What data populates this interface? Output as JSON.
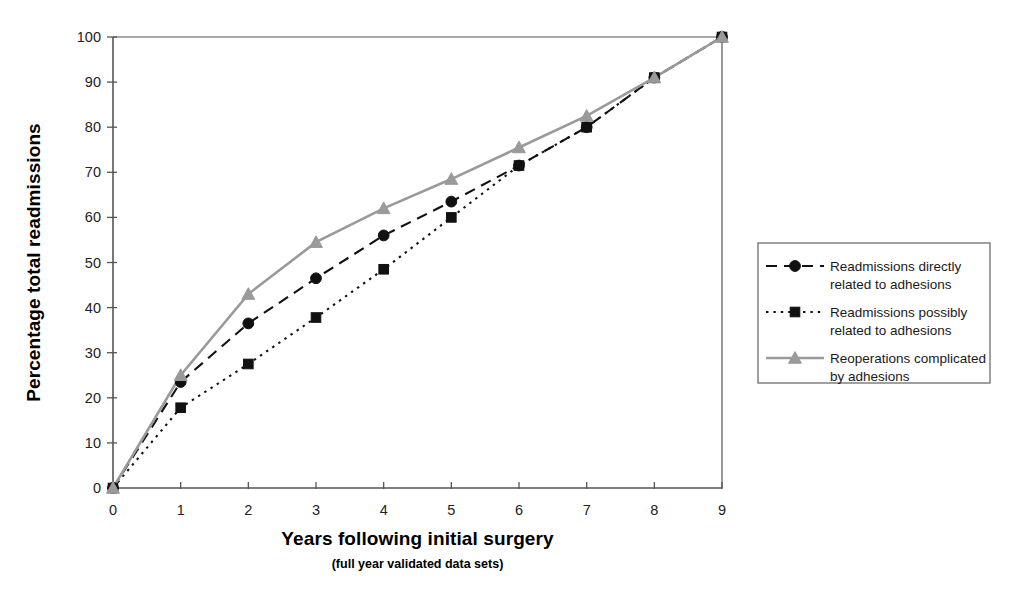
{
  "chart_data": {
    "type": "line",
    "title": "",
    "xlabel": "Years following initial surgery",
    "xlabel_sub": "(full year validated data sets)",
    "ylabel": "Percentage total readmissions",
    "x": [
      0,
      1,
      2,
      3,
      4,
      5,
      6,
      7,
      8,
      9
    ],
    "xlim": [
      0,
      9
    ],
    "ylim": [
      0,
      100
    ],
    "xticks": [
      "0",
      "1",
      "2",
      "3",
      "4",
      "5",
      "6",
      "7",
      "8",
      "9"
    ],
    "yticks": [
      "0",
      "10",
      "20",
      "30",
      "40",
      "50",
      "60",
      "70",
      "80",
      "90",
      "100"
    ],
    "grid": false,
    "legend_position": "right",
    "series": [
      {
        "name": "Readmissions directly related to adhesions",
        "legend_line1": "Readmissions directly",
        "legend_line2": "related to adhesions",
        "values": [
          0,
          23.5,
          36.5,
          46.5,
          56,
          63.5,
          71.5,
          80,
          91,
          100
        ],
        "color": "#111111",
        "linestyle": "dashed",
        "marker": "circle"
      },
      {
        "name": "Readmissions possibly related to adhesions",
        "legend_line1": "Readmissions possibly",
        "legend_line2": "related to adhesions",
        "values": [
          0,
          17.8,
          27.5,
          37.8,
          48.5,
          60,
          71.5,
          80,
          91,
          100
        ],
        "color": "#111111",
        "linestyle": "dotted",
        "marker": "square"
      },
      {
        "name": "Reoperations complicated by adhesions",
        "legend_line1": "Reoperations complicated",
        "legend_line2": "by adhesions",
        "values": [
          0,
          25,
          43,
          54.5,
          62,
          68.5,
          75.5,
          82.5,
          91,
          100
        ],
        "color": "#9a9a9a",
        "linestyle": "solid",
        "marker": "triangle"
      }
    ]
  },
  "legend": {
    "border_color": "#6e6e6e"
  },
  "axis": {
    "line_color": "#555555"
  }
}
